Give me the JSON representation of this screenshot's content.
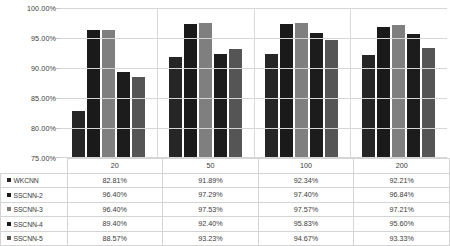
{
  "chart_data": {
    "type": "bar",
    "title": "",
    "xlabel": "",
    "ylabel": "",
    "categories": [
      "20",
      "50",
      "100",
      "200"
    ],
    "ylim": [
      75,
      100
    ],
    "ytick_labels": [
      "100.00%",
      "95.00%",
      "90.00%",
      "85.00%",
      "80.00%",
      "75.00%"
    ],
    "ytick_values": [
      100,
      95,
      90,
      85,
      80,
      75
    ],
    "grid": true,
    "legend_position": "table-left",
    "series": [
      {
        "name": "WKCNN",
        "color": "#262626",
        "values": [
          82.81,
          91.89,
          92.34,
          92.21
        ],
        "labels": [
          "82.81%",
          "91.89%",
          "92.34%",
          "92.21%"
        ]
      },
      {
        "name": "SSCNN-2",
        "color": "#1a1a1a",
        "values": [
          96.4,
          97.29,
          97.4,
          96.84
        ],
        "labels": [
          "96.40%",
          "97.29%",
          "97.40%",
          "96.84%"
        ]
      },
      {
        "name": "SSCNN-3",
        "color": "#7f7f7f",
        "values": [
          96.4,
          97.53,
          97.57,
          97.21
        ],
        "labels": [
          "96.40%",
          "97.53%",
          "97.57%",
          "97.21%"
        ]
      },
      {
        "name": "SSCNN-4",
        "color": "#1c1c1c",
        "values": [
          89.4,
          92.4,
          95.83,
          95.6
        ],
        "labels": [
          "89.40%",
          "92.40%",
          "95.83%",
          "95.60%"
        ]
      },
      {
        "name": "SSCNN-5",
        "color": "#555555",
        "values": [
          88.57,
          93.23,
          94.67,
          93.33
        ],
        "labels": [
          "88.57%",
          "93.23%",
          "94.67%",
          "93.33%"
        ]
      }
    ]
  }
}
